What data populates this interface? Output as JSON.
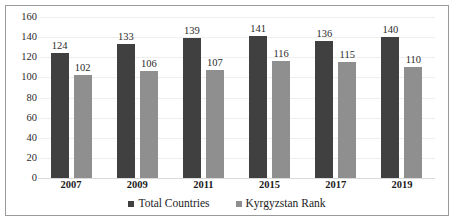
{
  "chart_data": {
    "type": "bar",
    "title": "",
    "subtitle": "",
    "xlabel": "",
    "ylabel": "",
    "categories": [
      "2007",
      "2009",
      "2011",
      "2015",
      "2017",
      "2019"
    ],
    "series": [
      {
        "name": "Total Countries",
        "color": "#404040",
        "values": [
          124,
          133,
          139,
          141,
          136,
          140
        ]
      },
      {
        "name": "Kyrgyzstan Rank",
        "color": "#8f8f8f",
        "values": [
          102,
          106,
          107,
          116,
          115,
          110
        ]
      }
    ],
    "ylim": [
      0,
      160
    ],
    "ytick_step": 20,
    "yticks": [
      0,
      20,
      40,
      60,
      80,
      100,
      120,
      140,
      160
    ],
    "ytick_labels": [
      "0",
      "20",
      "40",
      "60",
      "80",
      "100",
      "120",
      "140",
      "160"
    ],
    "grid": true,
    "grid_axis": "y",
    "legend_position": "bottom",
    "data_labels": true,
    "border": true,
    "border_color": "#9a9a9a",
    "background": "#ffffff",
    "gridline_color": "#eeeeee"
  }
}
